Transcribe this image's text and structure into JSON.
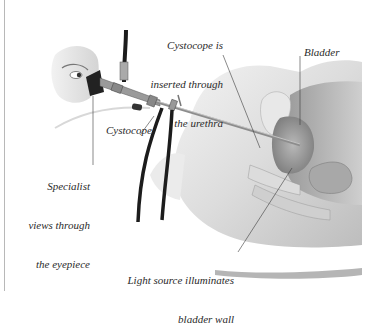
{
  "figure": {
    "labels": {
      "cystoscope_inserted": [
        "Cystocope is",
        "inserted through",
        "the urethra"
      ],
      "bladder": "Bladder",
      "cystoscope": "Cystocope",
      "specialist": [
        "Specialist",
        "views through",
        "the eyepiece"
      ],
      "light_source": [
        "Light source illuminates",
        "bladder wall"
      ]
    },
    "colors": {
      "background": "#ffffff",
      "text": "#2a2a2a",
      "leader_line": "#3a3a3a",
      "tissue_light": "#e6e6e6",
      "tissue_mid": "#c4c4c4",
      "tissue_dark": "#8c8c8c",
      "cable": "#1c1c1c",
      "metal": "#a9a9a9"
    }
  }
}
